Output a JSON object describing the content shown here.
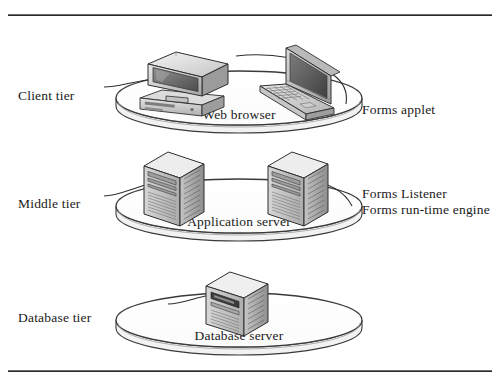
{
  "figure": {
    "ink_color": "#1a1a1a",
    "rule_color": "#2b2b2b",
    "background": "#ffffff"
  },
  "tiers": [
    {
      "id": "client",
      "label": "Client tier",
      "platter_caption": "Web browser",
      "devices": [
        "desktop-computer",
        "laptop-computer"
      ],
      "callouts": [
        "Forms applet"
      ]
    },
    {
      "id": "middle",
      "label": "Middle tier",
      "platter_caption": "Application server",
      "devices": [
        "tower-server",
        "tower-server"
      ],
      "callouts": [
        "Forms Listener",
        "Forms run-time engine"
      ]
    },
    {
      "id": "database",
      "label": "Database tier",
      "platter_caption": "Database server",
      "devices": [
        "tower-server"
      ],
      "callouts": []
    }
  ]
}
